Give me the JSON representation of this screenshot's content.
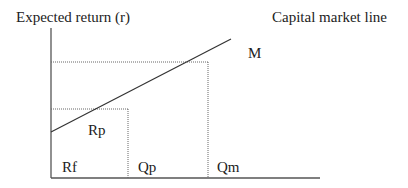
{
  "diagram": {
    "title_y_axis": "Expected return (r)",
    "title_line": "Capital market line",
    "labels": {
      "market_portfolio": "M",
      "portfolio_return": "Rp",
      "risk_free_rate": "Rf",
      "portfolio_quantity": "Qp",
      "market_quantity": "Qm"
    },
    "colors": {
      "axis": "#555555",
      "line": "#333333",
      "dotted": "#666666",
      "text": "#222222"
    }
  }
}
